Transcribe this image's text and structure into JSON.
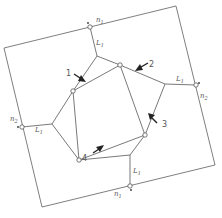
{
  "diagram": {
    "title": "",
    "boundary_labels": {
      "top": "n",
      "top_sub": "1",
      "right": "n",
      "right_sub": "2",
      "left": "n",
      "left_sub": "2",
      "bottom": "n",
      "bottom_sub": "1"
    },
    "segment_labels": {
      "top": "L",
      "top_sub": "1",
      "right": "L",
      "right_sub": "1",
      "left": "L",
      "left_sub": "1",
      "bottom": "L",
      "bottom_sub": "1"
    },
    "arrows": [
      {
        "id": "1",
        "label": "1"
      },
      {
        "id": "2",
        "label": "2"
      },
      {
        "id": "3",
        "label": "3"
      },
      {
        "id": "4",
        "label": "4"
      }
    ],
    "colors": {
      "line": "#6a6a6a",
      "arrow": "#222222",
      "background": "#ffffff"
    }
  }
}
